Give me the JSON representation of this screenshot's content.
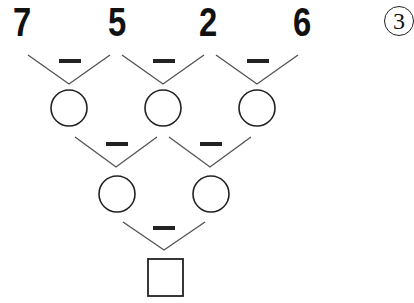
{
  "problem_number": "3",
  "operator": "−",
  "top_row": [
    "7",
    "5",
    "2",
    "6"
  ],
  "rows": [
    {
      "operators": [
        "−",
        "−",
        "−"
      ],
      "blanks": [
        "circle",
        "circle",
        "circle"
      ]
    },
    {
      "operators": [
        "−",
        "−"
      ],
      "blanks": [
        "circle",
        "circle"
      ]
    },
    {
      "operators": [
        "−"
      ],
      "blanks": [
        "square"
      ]
    }
  ],
  "colors": {
    "ink": "#111111",
    "line": "#555555"
  }
}
